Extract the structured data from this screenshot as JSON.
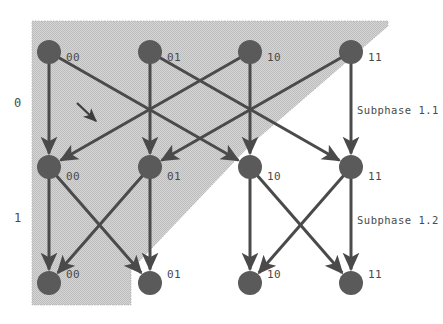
{
  "figure": {
    "type": "diagram",
    "background_color": "#ffffff",
    "shade_color": "#c9c9c9",
    "node_color": "#5a5a5a",
    "edge_color": "#4a4a4a",
    "text_color": "#4a4a4a"
  },
  "row_labels": [
    {
      "text": "0",
      "x": 14,
      "y": 107
    },
    {
      "text": "1",
      "x": 14,
      "y": 222
    }
  ],
  "phase_labels": [
    {
      "text": "Subphase 1.1",
      "x": 357,
      "y": 114
    },
    {
      "text": "Subphase 1.2",
      "x": 357,
      "y": 224
    }
  ],
  "edge_annotation": {
    "text": "L",
    "x": 66,
    "y": 99
  },
  "columns": [
    49,
    150,
    250,
    351
  ],
  "rows": [
    52,
    167,
    283
  ],
  "node_radius": 12,
  "nodes": [
    {
      "id": "r0c0",
      "label": "00",
      "cx": 49,
      "cy": 52,
      "lx": 66,
      "ly": 61
    },
    {
      "id": "r0c1",
      "label": "01",
      "cx": 150,
      "cy": 52,
      "lx": 167,
      "ly": 61
    },
    {
      "id": "r0c2",
      "label": "10",
      "cx": 250,
      "cy": 52,
      "lx": 267,
      "ly": 61
    },
    {
      "id": "r0c3",
      "label": "11",
      "cx": 351,
      "cy": 52,
      "lx": 368,
      "ly": 61
    },
    {
      "id": "r1c0",
      "label": "00",
      "cx": 49,
      "cy": 167,
      "lx": 66,
      "ly": 180
    },
    {
      "id": "r1c1",
      "label": "01",
      "cx": 150,
      "cy": 167,
      "lx": 167,
      "ly": 180
    },
    {
      "id": "r1c2",
      "label": "10",
      "cx": 250,
      "cy": 167,
      "lx": 267,
      "ly": 180
    },
    {
      "id": "r1c3",
      "label": "11",
      "cx": 351,
      "cy": 167,
      "lx": 368,
      "ly": 180
    },
    {
      "id": "r2c0",
      "label": "00",
      "cx": 49,
      "cy": 283,
      "lx": 66,
      "ly": 278
    },
    {
      "id": "r2c1",
      "label": "01",
      "cx": 150,
      "cy": 283,
      "lx": 167,
      "ly": 278
    },
    {
      "id": "r2c2",
      "label": "10",
      "cx": 250,
      "cy": 283,
      "lx": 267,
      "ly": 278
    },
    {
      "id": "r2c3",
      "label": "11",
      "cx": 351,
      "cy": 283,
      "lx": 368,
      "ly": 278
    }
  ],
  "edges_subphase_1_1": [
    {
      "from": "r0c0",
      "to": "r1c0"
    },
    {
      "from": "r0c1",
      "to": "r1c1"
    },
    {
      "from": "r0c2",
      "to": "r1c2"
    },
    {
      "from": "r0c3",
      "to": "r1c3"
    },
    {
      "from": "r0c0",
      "to": "r1c2"
    },
    {
      "from": "r0c2",
      "to": "r1c0"
    },
    {
      "from": "r0c1",
      "to": "r1c3"
    },
    {
      "from": "r0c3",
      "to": "r1c1"
    }
  ],
  "edges_subphase_1_2": [
    {
      "from": "r1c0",
      "to": "r2c0"
    },
    {
      "from": "r1c1",
      "to": "r2c1"
    },
    {
      "from": "r1c2",
      "to": "r2c2"
    },
    {
      "from": "r1c3",
      "to": "r2c3"
    },
    {
      "from": "r1c0",
      "to": "r2c1"
    },
    {
      "from": "r1c1",
      "to": "r2c0"
    },
    {
      "from": "r1c2",
      "to": "r2c3"
    },
    {
      "from": "r1c3",
      "to": "r2c2"
    }
  ],
  "shaded_region": {
    "points": "32,21 388,21 388,26 250,145 131,270 131,305 32,305"
  }
}
